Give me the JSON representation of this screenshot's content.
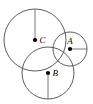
{
  "figure": {
    "type": "geometry-diagram",
    "width": 93,
    "height": 104,
    "background_color": "#ffffff",
    "stroke_color": "#4a4a4a",
    "radius_line_color": "#6b6b6b",
    "dot_color": "#000000",
    "label_color": "#000000"
  },
  "circles": [
    {
      "id": "circle-c",
      "label": "C",
      "cx": 35,
      "cy": 40,
      "r": 31,
      "dot_r": 2.1,
      "label_x": 39.5,
      "label_y": 41,
      "radius_line": {
        "direction": "up",
        "x1": 35,
        "y1": 40,
        "x2": 35,
        "y2": 9
      }
    },
    {
      "id": "circle-a",
      "label": "A",
      "cx": 70,
      "cy": 49,
      "r": 17,
      "dot_r": 2.1,
      "label_x": 70,
      "label_y": 42,
      "label_anchor": "middle",
      "radius_line": {
        "direction": "right",
        "x1": 70,
        "y1": 49,
        "x2": 87,
        "y2": 49
      }
    },
    {
      "id": "circle-b",
      "label": "B",
      "cx": 48,
      "cy": 73,
      "r": 26,
      "dot_r": 2.1,
      "label_x": 52.5,
      "label_y": 74,
      "radius_line": {
        "direction": "down",
        "x1": 48,
        "y1": 73,
        "x2": 48,
        "y2": 99
      }
    }
  ]
}
